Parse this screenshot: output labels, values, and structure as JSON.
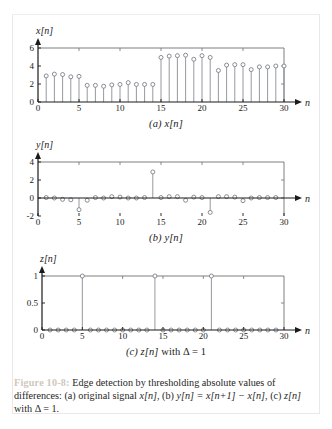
{
  "figure": {
    "number_label": "Figure 10-8:",
    "caption_part1": " Edge detection by thresholding absolute values of differences: (a) original signal ",
    "caption_sig_a": "x[n]",
    "caption_part2": ", (b) ",
    "caption_eq_b": "y[n] = x[n+1] − x[n]",
    "caption_part3": ", (c) ",
    "caption_sig_c": "z[n]",
    "caption_part4": " with Δ = 1.",
    "fignum_color": "#cfc8bd"
  },
  "subcaptions": {
    "a": "(a) x[n]",
    "b": "(b) y[n]",
    "c": "(c) z[n] with Δ = 1"
  },
  "style": {
    "stem_color": "#8a8d93",
    "marker_edge": "#7d8087",
    "marker_fill": "#ffffff",
    "axis_color": "#1a1a1a",
    "frame_color": "#6f6f6f",
    "page_bg": "#ffffff"
  },
  "chart_data": [
    {
      "type": "scatter",
      "id": "plot-a",
      "title": "(a) x[n]",
      "xlabel": "n",
      "ylabel": "x[n]",
      "xlim": [
        0,
        30
      ],
      "ylim": [
        0,
        6
      ],
      "xticks": [
        0,
        5,
        10,
        15,
        20,
        25,
        30
      ],
      "yticks": [
        0,
        2,
        4,
        6
      ],
      "grid": false,
      "legend": "none",
      "x": [
        1,
        2,
        3,
        4,
        5,
        6,
        7,
        8,
        9,
        10,
        11,
        12,
        13,
        14,
        15,
        16,
        17,
        18,
        19,
        20,
        21,
        22,
        23,
        24,
        25,
        26,
        27,
        28,
        29,
        30
      ],
      "values": [
        2.9,
        3.1,
        3.05,
        2.8,
        2.85,
        1.85,
        1.85,
        1.75,
        1.9,
        1.95,
        2.15,
        1.95,
        1.95,
        1.95,
        4.95,
        5.1,
        5.15,
        5.2,
        4.75,
        5.15,
        4.95,
        3.5,
        4.1,
        4.15,
        4.15,
        3.6,
        3.9,
        3.9,
        4.0,
        4.0
      ]
    },
    {
      "type": "scatter",
      "id": "plot-b",
      "title": "(b) y[n]",
      "xlabel": "n",
      "ylabel": "y[n]",
      "xlim": [
        0,
        30
      ],
      "ylim": [
        -2,
        4
      ],
      "xticks": [
        0,
        5,
        10,
        15,
        20,
        25,
        30
      ],
      "yticks": [
        -2,
        0,
        2,
        4
      ],
      "grid": false,
      "legend": "none",
      "x": [
        1,
        2,
        3,
        4,
        5,
        6,
        7,
        8,
        9,
        10,
        11,
        12,
        13,
        14,
        15,
        16,
        17,
        18,
        19,
        20,
        21,
        22,
        23,
        24,
        25,
        26,
        27,
        28,
        29
      ],
      "values": [
        0.05,
        0.0,
        -0.15,
        -0.2,
        -1.3,
        -0.25,
        0.05,
        0.0,
        0.15,
        0.1,
        0.0,
        0.0,
        0.05,
        2.9,
        0.05,
        0.15,
        0.15,
        -0.25,
        0.1,
        0.05,
        -1.6,
        0.15,
        0.15,
        0.1,
        -0.3,
        0.0,
        0.05,
        0.05,
        0.05
      ]
    },
    {
      "type": "scatter",
      "id": "plot-c",
      "title": "(c) z[n] with Δ = 1",
      "xlabel": "n",
      "ylabel": "z[n]",
      "xlim": [
        0,
        30
      ],
      "ylim": [
        0,
        1
      ],
      "xticks": [
        0,
        5,
        10,
        15,
        20,
        25,
        30
      ],
      "yticks": [
        0,
        0.5,
        1
      ],
      "ytick_labels": [
        "0",
        "0.5",
        "1"
      ],
      "grid": false,
      "legend": "none",
      "x": [
        1,
        2,
        3,
        4,
        5,
        6,
        7,
        8,
        9,
        10,
        11,
        12,
        13,
        14,
        15,
        16,
        17,
        18,
        19,
        20,
        21,
        22,
        23,
        24,
        25,
        26,
        27,
        28,
        29
      ],
      "values": [
        0,
        0,
        0,
        0,
        1,
        0,
        0,
        0,
        0,
        0,
        0,
        0,
        0,
        1,
        0,
        0,
        0,
        0,
        0,
        0,
        1,
        0,
        0,
        0,
        0,
        0,
        0,
        0,
        0
      ]
    }
  ]
}
